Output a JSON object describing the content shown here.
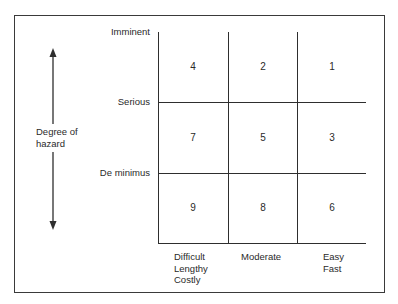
{
  "diagram": {
    "type": "hazard-priority-matrix",
    "y_axis": {
      "title_line1": "Degree of",
      "title_line2": "hazard",
      "levels": [
        "Imminent",
        "Serious",
        "De minimus"
      ]
    },
    "x_axis": {
      "columns": [
        {
          "lines": [
            "Difficult",
            "Lengthy",
            "Costly"
          ]
        },
        {
          "lines": [
            "Moderate"
          ]
        },
        {
          "lines": [
            "Easy",
            "Fast"
          ]
        }
      ]
    },
    "grid": [
      [
        "4",
        "2",
        "1"
      ],
      [
        "7",
        "5",
        "3"
      ],
      [
        "9",
        "8",
        "6"
      ]
    ],
    "colors": {
      "line": "#2e2e2e",
      "text": "#2a2a2a",
      "background": "#ffffff"
    }
  }
}
